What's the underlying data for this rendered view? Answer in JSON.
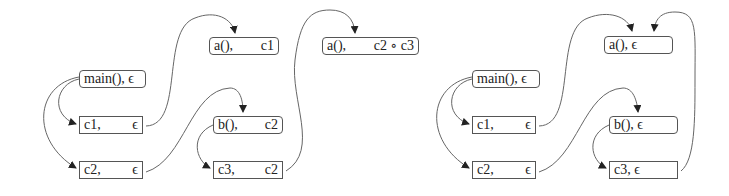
{
  "diagrams": [
    {
      "id": "left",
      "nodes": [
        {
          "key": "main",
          "label": "main(), ϵ",
          "left": "main(), ϵ",
          "right": "",
          "shape": "rounded"
        },
        {
          "key": "c1",
          "left": "c1,",
          "right": "ϵ",
          "shape": "rect"
        },
        {
          "key": "c2",
          "left": "c2,",
          "right": "ϵ",
          "shape": "rect"
        },
        {
          "key": "a",
          "left": "a(),",
          "right": "c1",
          "shape": "rounded"
        },
        {
          "key": "b",
          "left": "b(),",
          "right": "c2",
          "shape": "rounded"
        },
        {
          "key": "c3",
          "left": "c3,",
          "right": "c2",
          "shape": "rect"
        },
        {
          "key": "a2",
          "left": "a(),",
          "right": "c2 ∘ c3",
          "shape": "rounded"
        }
      ]
    },
    {
      "id": "right",
      "nodes": [
        {
          "key": "main",
          "left": "main(), ϵ",
          "right": "",
          "shape": "rounded"
        },
        {
          "key": "c1",
          "left": "c1,",
          "right": "ϵ",
          "shape": "rect"
        },
        {
          "key": "c2",
          "left": "c2,",
          "right": "ϵ",
          "shape": "rect"
        },
        {
          "key": "a",
          "left": "a(),  ϵ",
          "right": "",
          "shape": "rounded"
        },
        {
          "key": "b",
          "left": "b(),  ϵ",
          "right": "",
          "shape": "rounded"
        },
        {
          "key": "c3",
          "left": "c3,  ϵ",
          "right": "",
          "shape": "rect"
        }
      ]
    }
  ],
  "colors": {
    "stroke": "#555555",
    "arrow": "#222222",
    "text": "#222222"
  }
}
